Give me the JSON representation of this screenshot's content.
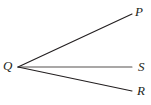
{
  "figure": {
    "background_color": "#ffffff",
    "width": 151,
    "height": 105,
    "stroke_color": "#231f20",
    "ray_s_stroke_color": "#55504f",
    "stroke_width": 1.1
  },
  "labels": {
    "vertex": "Q",
    "ray_upper": "P",
    "ray_middle": "S",
    "ray_lower": "R"
  },
  "chart_data": {
    "type": "diagram",
    "vertex": {
      "name": "Q",
      "x": 18,
      "y": 67
    },
    "rays": [
      {
        "name": "QP",
        "label": "P",
        "from": [
          18,
          67
        ],
        "to": [
          132,
          14
        ],
        "stroke": "#231f20"
      },
      {
        "name": "QS",
        "label": "S",
        "from": [
          18,
          67
        ],
        "to": [
          132,
          67
        ],
        "stroke": "#55504f"
      },
      {
        "name": "QR",
        "label": "R",
        "from": [
          18,
          67
        ],
        "to": [
          132,
          91
        ],
        "stroke": "#231f20"
      }
    ],
    "label_positions": [
      {
        "text": "Q",
        "x": 3,
        "y": 59
      },
      {
        "text": "P",
        "x": 135,
        "y": 5
      },
      {
        "text": "S",
        "x": 138,
        "y": 60
      },
      {
        "text": "R",
        "x": 137,
        "y": 84
      }
    ]
  }
}
